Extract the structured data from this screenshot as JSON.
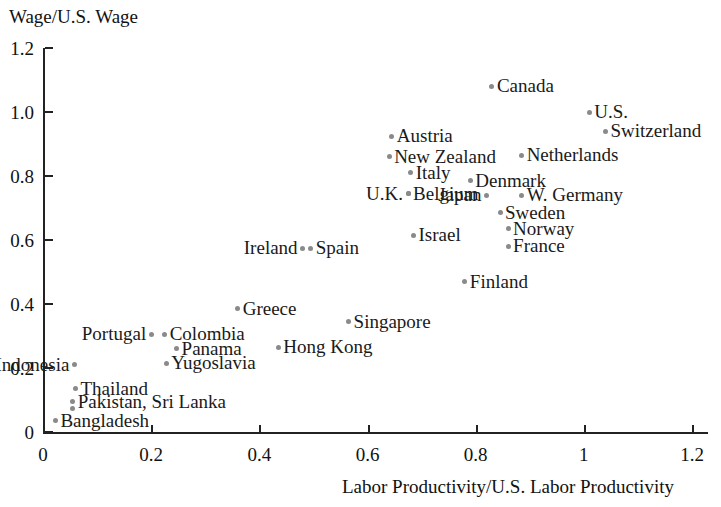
{
  "chart_data": {
    "type": "scatter",
    "title": "",
    "ylabel": "Wage/U.S. Wage",
    "xlabel": "Labor Productivity/U.S. Labor Productivity",
    "xlim": [
      0,
      1.2
    ],
    "ylim": [
      0,
      1.2
    ],
    "grid": false,
    "legend": "none",
    "xticks": [
      "0",
      "0.2",
      "0.4",
      "0.6",
      "0.8",
      "1",
      "1.2"
    ],
    "xtick_values": [
      0,
      0.2,
      0.4,
      0.6,
      0.8,
      1.0,
      1.2
    ],
    "yticks": [
      "0",
      "0.2",
      "0.4",
      "0.6",
      "0.8",
      "1.0",
      "1.2"
    ],
    "ytick_values": [
      0,
      0.2,
      0.4,
      0.6,
      0.8,
      1.0,
      1.2
    ],
    "point_color": "#8a8a8a",
    "points": [
      {
        "label": "Canada",
        "x": 0.83,
        "y": 1.08,
        "side": "right"
      },
      {
        "label": "U.S.",
        "x": 1.01,
        "y": 1.0,
        "side": "right"
      },
      {
        "label": "Switzerland",
        "x": 1.04,
        "y": 0.94,
        "side": "right"
      },
      {
        "label": "Austria",
        "x": 0.645,
        "y": 0.925,
        "side": "right"
      },
      {
        "label": "New Zealand",
        "x": 0.64,
        "y": 0.86,
        "side": "right"
      },
      {
        "label": "Netherlands",
        "x": 0.885,
        "y": 0.865,
        "side": "right"
      },
      {
        "label": "Italy",
        "x": 0.68,
        "y": 0.81,
        "side": "right"
      },
      {
        "label": "Denmark",
        "x": 0.79,
        "y": 0.785,
        "side": "right"
      },
      {
        "label": "U.K.",
        "x": 0.675,
        "y": 0.745,
        "side": "left"
      },
      {
        "label": "Belgium",
        "x": 0.675,
        "y": 0.745,
        "side": "right"
      },
      {
        "label": "W. Germany",
        "x": 0.885,
        "y": 0.74,
        "side": "right"
      },
      {
        "label": "Japan",
        "x": 0.82,
        "y": 0.74,
        "side": "left"
      },
      {
        "label": "Sweden",
        "x": 0.845,
        "y": 0.685,
        "side": "right"
      },
      {
        "label": "Norway",
        "x": 0.86,
        "y": 0.635,
        "side": "right"
      },
      {
        "label": "Israel",
        "x": 0.685,
        "y": 0.615,
        "side": "right"
      },
      {
        "label": "France",
        "x": 0.86,
        "y": 0.58,
        "side": "right"
      },
      {
        "label": "Ireland",
        "x": 0.48,
        "y": 0.575,
        "side": "left"
      },
      {
        "label": "Spain",
        "x": 0.495,
        "y": 0.575,
        "side": "right"
      },
      {
        "label": "Finland",
        "x": 0.78,
        "y": 0.47,
        "side": "right"
      },
      {
        "label": "Greece",
        "x": 0.36,
        "y": 0.385,
        "side": "right"
      },
      {
        "label": "Singapore",
        "x": 0.565,
        "y": 0.345,
        "side": "right"
      },
      {
        "label": "Portugal",
        "x": 0.2,
        "y": 0.305,
        "side": "left"
      },
      {
        "label": "Colombia",
        "x": 0.225,
        "y": 0.305,
        "side": "right"
      },
      {
        "label": "Panama",
        "x": 0.247,
        "y": 0.26,
        "side": "right"
      },
      {
        "label": "Hong Kong",
        "x": 0.435,
        "y": 0.265,
        "side": "right"
      },
      {
        "label": "Indonesia",
        "x": 0.058,
        "y": 0.21,
        "side": "left"
      },
      {
        "label": "Yugoslavia",
        "x": 0.228,
        "y": 0.215,
        "side": "right"
      },
      {
        "label": "Thailand",
        "x": 0.06,
        "y": 0.135,
        "side": "right"
      },
      {
        "label": "Pakistan, Sri Lanka",
        "x": 0.055,
        "y": 0.095,
        "side": "right"
      },
      {
        "label": "Bangladesh",
        "x": 0.023,
        "y": 0.035,
        "side": "right"
      }
    ],
    "extra_points": [
      {
        "name": "sri-lanka-second-dot",
        "x": 0.055,
        "y": 0.075
      }
    ]
  }
}
